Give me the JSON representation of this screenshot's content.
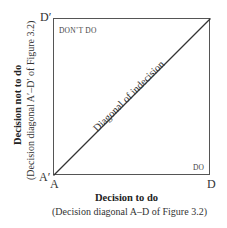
{
  "diagram": {
    "corners": {
      "top_left": "D′",
      "bottom_left_outer": "A′",
      "bottom_left": "A",
      "bottom_right": "D"
    },
    "regions": {
      "upper_left": "DON’T DO",
      "lower_right": "DO"
    },
    "diagonal_label": "Diagonal of indecision",
    "x_axis": {
      "title": "Decision to do",
      "subtitle": "(Decision diagonal A–D of Figure 3.2)"
    },
    "y_axis": {
      "title": "Decision not to do",
      "subtitle": "(Decision diagonal A′–D′ of Figure 3.2)"
    },
    "colors": {
      "line": "#333333",
      "frame": "#555555"
    }
  }
}
